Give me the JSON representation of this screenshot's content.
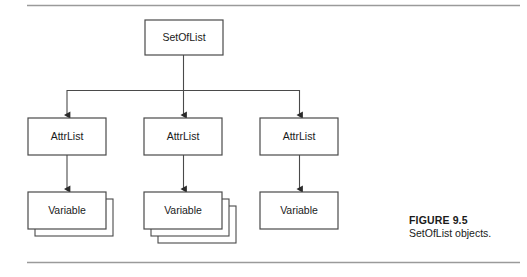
{
  "figure": {
    "caption_title": "FIGURE 9.5",
    "caption_text": "SetOfList objects.",
    "rule_color": "#999999",
    "line_color": "#3a3a3a",
    "box_stroke": "#3a3a3a",
    "box_fill": "#ffffff",
    "text_color": "#1a1a1a"
  },
  "diagram": {
    "type": "tree",
    "root": {
      "label": "SetOfList",
      "x": 145,
      "y": 20,
      "w": 78,
      "h": 35
    },
    "level2_label": "AttrList",
    "level3_label": "Variable",
    "columns": [
      {
        "attrlist": {
          "label": "AttrList",
          "x": 28,
          "y": 118,
          "w": 78,
          "h": 37
        },
        "variable": {
          "label": "Variable",
          "x": 28,
          "y": 192,
          "w": 78,
          "h": 37
        },
        "stack_count": 1
      },
      {
        "attrlist": {
          "label": "AttrList",
          "x": 144,
          "y": 118,
          "w": 78,
          "h": 37
        },
        "variable": {
          "label": "Variable",
          "x": 144,
          "y": 192,
          "w": 78,
          "h": 37
        },
        "stack_count": 2
      },
      {
        "attrlist": {
          "label": "AttrList",
          "x": 260,
          "y": 118,
          "w": 78,
          "h": 37
        },
        "variable": {
          "label": "Variable",
          "x": 260,
          "y": 192,
          "w": 78,
          "h": 37
        },
        "stack_count": 0
      }
    ],
    "bus_y": 90,
    "rules": {
      "x1": 27,
      "x2": 520,
      "top_y": 5,
      "bottom_y": 262
    }
  },
  "labels": {
    "root_label": "SetOfList",
    "attrlist_1": "AttrList",
    "attrlist_2": "AttrList",
    "attrlist_3": "AttrList",
    "variable_1": "Variable",
    "variable_2": "Variable",
    "variable_3": "Variable"
  }
}
